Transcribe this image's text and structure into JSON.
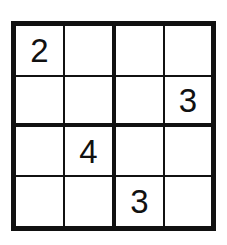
{
  "puzzle": {
    "type": "sudoku-4x4",
    "size": 4,
    "box_size": 2,
    "grid": [
      [
        "2",
        "",
        "",
        ""
      ],
      [
        "",
        "",
        "",
        "3"
      ],
      [
        "",
        "4",
        "",
        ""
      ],
      [
        "",
        "",
        "3",
        ""
      ]
    ],
    "cells": {
      "r0c0": "2",
      "r0c1": "",
      "r0c2": "",
      "r0c3": "",
      "r1c0": "",
      "r1c1": "",
      "r1c2": "",
      "r1c3": "3",
      "r2c0": "",
      "r2c1": "4",
      "r2c2": "",
      "r2c3": "",
      "r3c0": "",
      "r3c1": "",
      "r3c2": "3",
      "r3c3": ""
    }
  },
  "colors": {
    "line": "#111111",
    "digit": "#111111",
    "background": "#ffffff"
  }
}
